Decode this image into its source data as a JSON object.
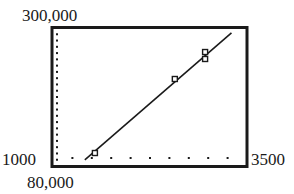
{
  "chart_data": {
    "type": "scatter",
    "title": "",
    "xlabel": "",
    "ylabel": "",
    "xlim": [
      1000,
      3500
    ],
    "ylim": [
      80000,
      300000
    ],
    "x_tick_step": 250,
    "y_tick_step": 10000,
    "window_labels": {
      "ymax": "300,000",
      "xmin": "1000",
      "xmax": "3500",
      "ymin": "80,000"
    },
    "grid": false,
    "legend": null,
    "series": [
      {
        "name": "data points",
        "style": "square-marker",
        "points": [
          {
            "x": 1540,
            "y": 100700
          },
          {
            "x": 2570,
            "y": 218700
          },
          {
            "x": 2960,
            "y": 261700
          },
          {
            "x": 2960,
            "y": 250600
          }
        ]
      },
      {
        "name": "regression line",
        "style": "line",
        "points": [
          {
            "x": 1410,
            "y": 89600
          },
          {
            "x": 3300,
            "y": 292100
          }
        ]
      }
    ]
  },
  "colors": {
    "ink": "#1a1a1a",
    "background": "#ffffff"
  }
}
